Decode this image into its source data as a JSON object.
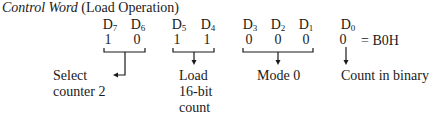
{
  "title": {
    "italic": "Control Word",
    "normal": " (Load Operation)"
  },
  "bits": [
    {
      "label": "D",
      "sub": "7",
      "value": "1"
    },
    {
      "label": "D",
      "sub": "6",
      "value": "0"
    },
    {
      "label": "D",
      "sub": "5",
      "value": "1"
    },
    {
      "label": "D",
      "sub": "4",
      "value": "1"
    },
    {
      "label": "D",
      "sub": "3",
      "value": "0"
    },
    {
      "label": "D",
      "sub": "2",
      "value": "0"
    },
    {
      "label": "D",
      "sub": "1",
      "value": "0"
    },
    {
      "label": "D",
      "sub": "0",
      "value": "0"
    }
  ],
  "result": "= B0H",
  "groups": [
    {
      "bits": "D7 D6",
      "lines": [
        "Select",
        "counter 2"
      ]
    },
    {
      "bits": "D5 D4",
      "lines": [
        "Load",
        "16-bit",
        "count"
      ]
    },
    {
      "bits": "D3 D2 D1",
      "lines": [
        "Mode 0"
      ]
    },
    {
      "bits": "D0",
      "lines": [
        "Count in binary"
      ]
    }
  ]
}
